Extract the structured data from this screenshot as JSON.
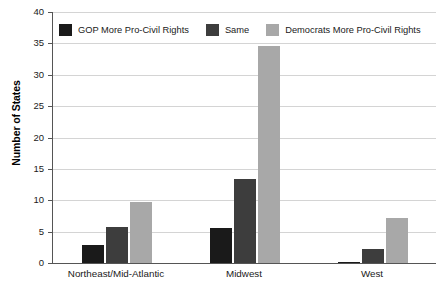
{
  "chart_data": {
    "type": "bar",
    "title": "",
    "subtitle": "",
    "xlabel": "",
    "ylabel": "Number of States",
    "ylim": [
      0,
      40
    ],
    "ytick_interval": 5,
    "yticks": [
      "40",
      "35",
      "30",
      "25",
      "20",
      "15",
      "10",
      "5",
      "0"
    ],
    "grid": true,
    "grid_axis": "y",
    "legend_position": "top-left-inside",
    "categories": [
      "Northeast/Mid-Atlantic",
      "Midwest",
      "West"
    ],
    "series": [
      {
        "name": "GOP More Pro-Civil Rights",
        "color": "#1a1a1a",
        "values": [
          2.8,
          5.6,
          0
        ]
      },
      {
        "name": "Same",
        "color": "#3d3d3d",
        "values": [
          5.8,
          13.4,
          2.3
        ]
      },
      {
        "name": "Democrats More Pro-Civil Rights",
        "color": "#a8a8a8",
        "values": [
          9.8,
          34.6,
          7.2
        ]
      }
    ]
  },
  "axes": {
    "y_title": "Number of States",
    "y_tick_labels": [
      "40",
      "35",
      "30",
      "25",
      "20",
      "15",
      "10",
      "5",
      "0"
    ],
    "x_tick_labels": [
      "Northeast/Mid-Atlantic",
      "Midwest",
      "West"
    ]
  },
  "legend": {
    "items": [
      {
        "label": "GOP More Pro-Civil Rights",
        "color": "#1a1a1a"
      },
      {
        "label": "Same",
        "color": "#3d3d3d"
      },
      {
        "label": "Democrats More Pro-Civil Rights",
        "color": "#a8a8a8"
      }
    ]
  },
  "colors": {
    "series_gop": "#1a1a1a",
    "series_same": "#3d3d3d",
    "series_dem": "#a8a8a8",
    "gridline": "#d4d4d4",
    "axis": "#555555",
    "background": "#ffffff",
    "text": "#1a1a1a"
  }
}
